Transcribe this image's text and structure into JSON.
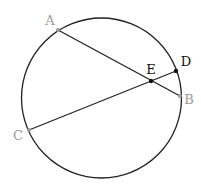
{
  "diagram": {
    "type": "circle-with-intersecting-chords",
    "circle": {
      "cx": 101.5,
      "cy": 98,
      "r": 80,
      "stroke": "#222222"
    },
    "colors": {
      "line": "#222222",
      "gray_point": "#999999",
      "gray_label": "#999999",
      "black_point": "#111111",
      "black_label": "#111111"
    },
    "points": {
      "A": {
        "label": "A",
        "x": 58,
        "y": 30,
        "label_x": 50,
        "label_y": 25,
        "style": "gray"
      },
      "B": {
        "label": "B",
        "x": 180,
        "y": 96,
        "label_x": 189,
        "label_y": 104,
        "style": "gray"
      },
      "C": {
        "label": "C",
        "x": 29,
        "y": 130,
        "label_x": 18,
        "label_y": 140,
        "style": "gray"
      },
      "D": {
        "label": "D",
        "x": 176,
        "y": 71,
        "label_x": 185,
        "label_y": 66,
        "style": "black"
      },
      "E": {
        "label": "E",
        "x": 151,
        "y": 81,
        "label_x": 151,
        "label_y": 73,
        "style": "black"
      }
    },
    "segments": [
      {
        "from": "A",
        "to": "B"
      },
      {
        "from": "C",
        "to": "D"
      }
    ]
  }
}
